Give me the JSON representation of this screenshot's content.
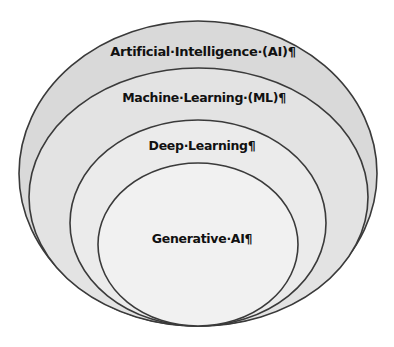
{
  "diagram": {
    "type": "nested-ellipses",
    "title": "",
    "layers": [
      {
        "label": "Artificial·Intelligence·(AI)¶",
        "fill": "#d9d9d9",
        "stroke": "#3a3a3a",
        "cx": 198,
        "cy": 173.5,
        "rx": 179,
        "ry": 152.5,
        "label_x": 203,
        "label_y": 44,
        "font_size": 13
      },
      {
        "label": "Machine·Learning·(ML)¶",
        "fill": "#e3e3e3",
        "stroke": "#3a3a3a",
        "cx": 198.5,
        "cy": 197,
        "rx": 169.5,
        "ry": 129,
        "label_x": 204,
        "label_y": 90,
        "font_size": 12.5
      },
      {
        "label": "Deep·Learning¶",
        "fill": "#ebebeb",
        "stroke": "#3a3a3a",
        "cx": 198,
        "cy": 223,
        "rx": 128,
        "ry": 103,
        "label_x": 202,
        "label_y": 138,
        "font_size": 12.5
      },
      {
        "label": "Generative·AI¶",
        "fill": "#f1f1f1",
        "stroke": "#3a3a3a",
        "cx": 198,
        "cy": 244.5,
        "rx": 100,
        "ry": 81.5,
        "label_x": 202,
        "label_y": 231,
        "font_size": 12.5
      }
    ]
  },
  "colors": {
    "background": "#ffffff",
    "text": "#111111",
    "outline": "#3a3a3a"
  }
}
